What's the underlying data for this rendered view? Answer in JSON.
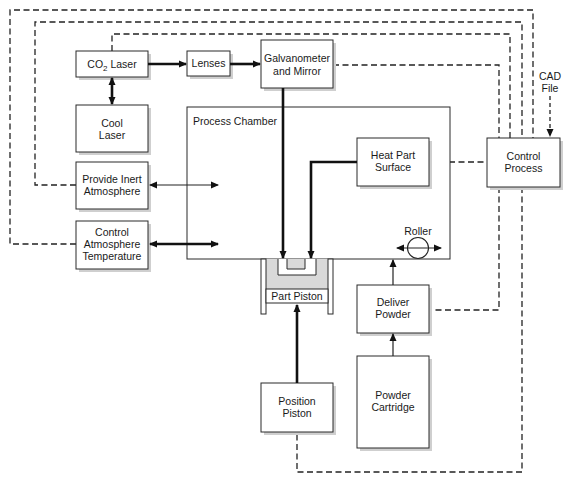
{
  "diagram": {
    "blocks": {
      "co2_laser": {
        "main": "CO",
        "sub": "2",
        "rest": " Laser"
      },
      "lenses": {
        "label": "Lenses"
      },
      "galvanometer": {
        "line1": "Galvanometer",
        "line2": "and Mirror"
      },
      "cool_laser": {
        "line1": "Cool",
        "line2": "Laser"
      },
      "process_chamber": {
        "label": "Process Chamber"
      },
      "provide_inert": {
        "line1": "Provide Inert",
        "line2": "Atmosphere"
      },
      "control_atmosphere": {
        "line1": "Control",
        "line2": "Atmosphere",
        "line3": "Temperature"
      },
      "heat_part": {
        "line1": "Heat Part",
        "line2": "Surface"
      },
      "control_process": {
        "line1": "Control",
        "line2": "Process"
      },
      "cad_file": {
        "line1": "CAD",
        "line2": "File"
      },
      "roller": {
        "label": "Roller"
      },
      "part_piston": {
        "label": "Part Piston"
      },
      "deliver_powder": {
        "line1": "Deliver",
        "line2": "Powder"
      },
      "position_piston": {
        "line1": "Position",
        "line2": "Piston"
      },
      "powder_cartridge": {
        "line1": "Powder",
        "line2": "Cartridge"
      }
    },
    "colors": {
      "line": "#222222",
      "shadow": "#cfcfcf",
      "chamber_fill": "#d9d9d9"
    }
  }
}
